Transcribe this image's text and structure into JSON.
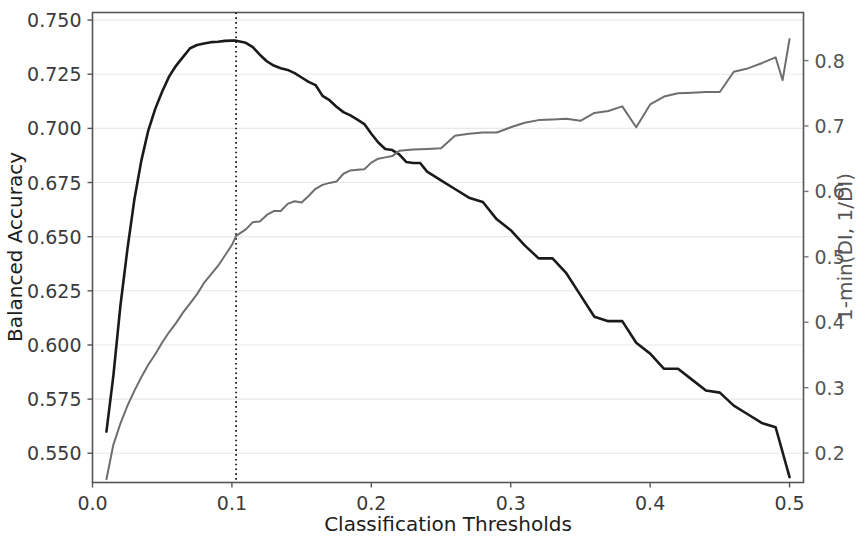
{
  "chart_data": {
    "type": "line",
    "title": "",
    "subtitle": "",
    "xlabel": "Classification Thresholds",
    "ylabel": "Balanced Accuracy",
    "y2label": "1-min(DI, 1/DI)",
    "xlim": [
      0.0,
      0.51
    ],
    "ylim": [
      0.5365,
      0.7535
    ],
    "y2lim": [
      0.155,
      0.8735
    ],
    "xticks": [
      0.0,
      0.1,
      0.2,
      0.3,
      0.4,
      0.5
    ],
    "xticklabels": [
      "0.0",
      "0.1",
      "0.2",
      "0.3",
      "0.4",
      "0.5"
    ],
    "yticks": [
      0.55,
      0.575,
      0.6,
      0.625,
      0.65,
      0.675,
      0.7,
      0.725,
      0.75
    ],
    "yticklabels": [
      "0.550",
      "0.575",
      "0.600",
      "0.625",
      "0.650",
      "0.675",
      "0.700",
      "0.725",
      "0.750"
    ],
    "y2ticks": [
      0.2,
      0.3,
      0.4,
      0.5,
      0.6,
      0.7,
      0.8
    ],
    "y2ticklabels": [
      "0.2",
      "0.3",
      "0.4",
      "0.5",
      "0.6",
      "0.7",
      "0.8"
    ],
    "grid": true,
    "grid_color": "#e8e8ee",
    "legend": null,
    "annotations": [
      {
        "name": "optimal-threshold-marker",
        "type": "vline",
        "x": 0.103,
        "style": "dotted",
        "color": "#1a1a1a"
      }
    ],
    "series": [
      {
        "name": "Balanced Accuracy",
        "axis": "left",
        "color": "#1a1a1a",
        "linewidth": 2.6,
        "x": [
          0.01,
          0.015,
          0.02,
          0.025,
          0.03,
          0.035,
          0.04,
          0.045,
          0.05,
          0.055,
          0.06,
          0.065,
          0.07,
          0.075,
          0.08,
          0.085,
          0.09,
          0.095,
          0.1,
          0.103,
          0.11,
          0.115,
          0.12,
          0.125,
          0.13,
          0.135,
          0.14,
          0.145,
          0.15,
          0.155,
          0.16,
          0.165,
          0.17,
          0.175,
          0.18,
          0.185,
          0.19,
          0.195,
          0.2,
          0.205,
          0.21,
          0.215,
          0.22,
          0.225,
          0.23,
          0.235,
          0.24,
          0.25,
          0.26,
          0.27,
          0.28,
          0.29,
          0.3,
          0.31,
          0.32,
          0.33,
          0.34,
          0.35,
          0.36,
          0.37,
          0.38,
          0.39,
          0.4,
          0.41,
          0.42,
          0.43,
          0.44,
          0.45,
          0.46,
          0.47,
          0.48,
          0.49,
          0.5
        ],
        "y": [
          0.56,
          0.586,
          0.618,
          0.644,
          0.667,
          0.685,
          0.699,
          0.709,
          0.717,
          0.724,
          0.729,
          0.733,
          0.737,
          0.7385,
          0.7392,
          0.7398,
          0.74,
          0.7404,
          0.7405,
          0.7405,
          0.7395,
          0.7375,
          0.734,
          0.731,
          0.729,
          0.7278,
          0.727,
          0.7255,
          0.7235,
          0.7215,
          0.72,
          0.715,
          0.713,
          0.71,
          0.7075,
          0.706,
          0.704,
          0.702,
          0.6975,
          0.6935,
          0.6905,
          0.69,
          0.688,
          0.6845,
          0.684,
          0.684,
          0.68,
          0.676,
          0.672,
          0.668,
          0.666,
          0.658,
          0.653,
          0.646,
          0.64,
          0.64,
          0.633,
          0.623,
          0.613,
          0.611,
          0.611,
          0.601,
          0.596,
          0.589,
          0.589,
          0.584,
          0.579,
          0.578,
          0.572,
          0.568,
          0.564,
          0.562,
          0.539
        ]
      },
      {
        "name": "1-min(DI, 1/DI)",
        "axis": "right",
        "color": "#6e6e6e",
        "linewidth": 2.0,
        "x": [
          0.01,
          0.015,
          0.02,
          0.025,
          0.03,
          0.035,
          0.04,
          0.045,
          0.05,
          0.055,
          0.06,
          0.065,
          0.07,
          0.075,
          0.08,
          0.085,
          0.09,
          0.095,
          0.1,
          0.103,
          0.11,
          0.115,
          0.12,
          0.125,
          0.13,
          0.135,
          0.14,
          0.145,
          0.15,
          0.155,
          0.16,
          0.165,
          0.17,
          0.175,
          0.18,
          0.185,
          0.19,
          0.195,
          0.2,
          0.205,
          0.21,
          0.215,
          0.22,
          0.23,
          0.24,
          0.25,
          0.26,
          0.27,
          0.28,
          0.29,
          0.3,
          0.31,
          0.32,
          0.33,
          0.34,
          0.35,
          0.36,
          0.37,
          0.38,
          0.39,
          0.4,
          0.41,
          0.42,
          0.43,
          0.44,
          0.45,
          0.46,
          0.47,
          0.48,
          0.49,
          0.495,
          0.5
        ],
        "y": [
          0.16,
          0.213,
          0.245,
          0.272,
          0.295,
          0.316,
          0.335,
          0.351,
          0.369,
          0.385,
          0.399,
          0.415,
          0.429,
          0.443,
          0.46,
          0.473,
          0.486,
          0.502,
          0.518,
          0.532,
          0.542,
          0.553,
          0.554,
          0.564,
          0.57,
          0.57,
          0.581,
          0.585,
          0.583,
          0.593,
          0.604,
          0.61,
          0.613,
          0.615,
          0.627,
          0.632,
          0.633,
          0.634,
          0.644,
          0.65,
          0.652,
          0.654,
          0.662,
          0.664,
          0.665,
          0.666,
          0.685,
          0.688,
          0.69,
          0.69,
          0.698,
          0.705,
          0.709,
          0.71,
          0.711,
          0.708,
          0.72,
          0.723,
          0.73,
          0.698,
          0.733,
          0.745,
          0.75,
          0.751,
          0.752,
          0.752,
          0.783,
          0.788,
          0.796,
          0.805,
          0.77,
          0.833
        ]
      }
    ]
  }
}
